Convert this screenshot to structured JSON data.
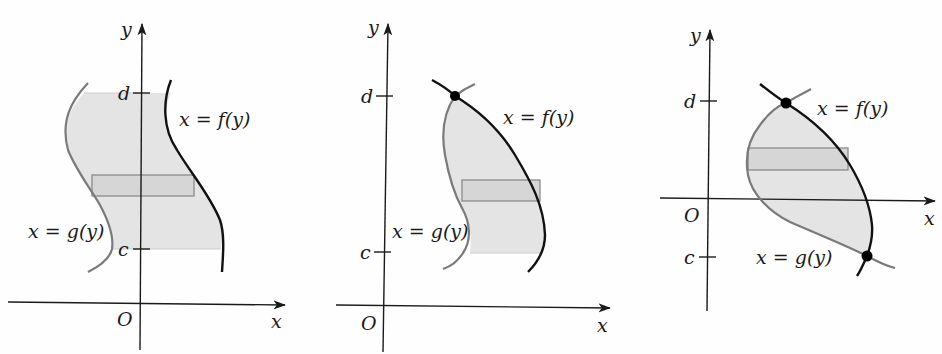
{
  "colors": {
    "axis": "#1a1a1a",
    "f_curve": "#111111",
    "g_curve": "#7a7a7a",
    "region_fill": "#e4e4e4",
    "strip_fill": "#d6d6d6",
    "strip_stroke": "#8a8a8a",
    "point": "#000000"
  },
  "panels": [
    {
      "id": "panel-1",
      "axis_labels": {
        "x": "x",
        "y": "y",
        "origin": "O"
      },
      "ticks": {
        "d": "d",
        "c": "c"
      },
      "curve_labels": {
        "f": "x = f(y)",
        "g": "x = g(y)"
      },
      "has_intersection_points": false
    },
    {
      "id": "panel-2",
      "axis_labels": {
        "x": "x",
        "y": "y",
        "origin": "O"
      },
      "ticks": {
        "d": "d",
        "c": "c"
      },
      "curve_labels": {
        "f": "x = f(y)",
        "g": "x = g(y)"
      },
      "has_intersection_points": true,
      "intersection_count": 1
    },
    {
      "id": "panel-3",
      "axis_labels": {
        "x": "x",
        "y": "y",
        "origin": "O"
      },
      "ticks": {
        "d": "d",
        "c": "c"
      },
      "curve_labels": {
        "f": "x = f(y)",
        "g": "x = g(y)"
      },
      "has_intersection_points": true,
      "intersection_count": 2
    }
  ]
}
